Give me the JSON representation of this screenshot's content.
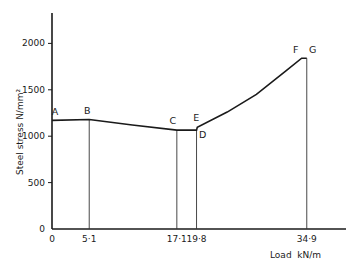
{
  "chart_data": {
    "type": "line",
    "title": "",
    "xlabel": "Load  kN/m",
    "ylabel": "Steel  stress  N/mm²",
    "xlim": [
      0,
      40
    ],
    "ylim": [
      0,
      2300
    ],
    "grid": false,
    "y_ticks": [
      0,
      500,
      1000,
      1500,
      2000
    ],
    "y_tick_labels": [
      "0",
      "500",
      "1000",
      "1500",
      "2000"
    ],
    "x_ticks": [
      0,
      5.1,
      17.1,
      19.8,
      34.9
    ],
    "x_tick_labels": [
      "0",
      "5·1",
      "17·1",
      "19·8",
      "34·9"
    ],
    "series": [
      {
        "name": "Steel stress",
        "points": [
          {
            "label": "A",
            "x": 0,
            "y": 1170
          },
          {
            "label": "B",
            "x": 5.1,
            "y": 1180
          },
          {
            "label": "",
            "x": 11,
            "y": 1120
          },
          {
            "label": "C",
            "x": 17.1,
            "y": 1065
          },
          {
            "label": "D",
            "x": 19.8,
            "y": 1065
          },
          {
            "label": "E",
            "x": 19.9,
            "y": 1095
          },
          {
            "label": "",
            "x": 24,
            "y": 1260
          },
          {
            "label": "",
            "x": 28,
            "y": 1450
          },
          {
            "label": "",
            "x": 32,
            "y": 1700
          },
          {
            "label": "F",
            "x": 34.2,
            "y": 1840
          },
          {
            "label": "G",
            "x": 34.9,
            "y": 1840
          }
        ]
      }
    ],
    "verticals": [
      5.1,
      17.1,
      19.8,
      34.9
    ]
  }
}
